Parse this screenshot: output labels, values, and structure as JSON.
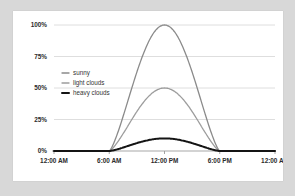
{
  "chart_data": {
    "type": "line",
    "title": "",
    "subtitle": "",
    "xlabel": "",
    "ylabel": "",
    "xlim": [
      0,
      24
    ],
    "ylim": [
      0,
      100
    ],
    "grid": true,
    "legend_position": "upper-left-inside",
    "x_tick_labels": [
      "12:00 AM",
      "6:00 AM",
      "12:00 PM",
      "6:00 PM",
      "12:00 AM"
    ],
    "x_tick_values": [
      0,
      6,
      12,
      18,
      24
    ],
    "y_tick_labels": [
      "0%",
      "25%",
      "50%",
      "75%",
      "100%"
    ],
    "y_tick_values": [
      0,
      25,
      50,
      75,
      100
    ],
    "x": [
      0,
      1,
      2,
      3,
      4,
      5,
      6,
      7,
      8,
      9,
      10,
      11,
      12,
      13,
      14,
      15,
      16,
      17,
      18,
      19,
      20,
      21,
      22,
      23,
      24
    ],
    "series": [
      {
        "name": "sunny",
        "color": "#8a8a8a",
        "width": 1.3,
        "peak": 100,
        "values": [
          0,
          0,
          0,
          0,
          0,
          0,
          0,
          25.9,
          50.0,
          70.7,
          86.6,
          96.6,
          100,
          96.6,
          86.6,
          70.7,
          50.0,
          25.9,
          0,
          0,
          0,
          0,
          0,
          0,
          0
        ]
      },
      {
        "name": "light clouds",
        "color": "#9d9d9d",
        "width": 1.3,
        "peak": 50,
        "values": [
          0,
          0,
          0,
          0,
          0,
          0,
          0,
          12.9,
          25.0,
          35.4,
          43.3,
          48.3,
          50,
          48.3,
          43.3,
          35.4,
          25.0,
          12.9,
          0,
          0,
          0,
          0,
          0,
          0,
          0
        ]
      },
      {
        "name": "heavy clouds",
        "color": "#141414",
        "width": 2.0,
        "peak": 10,
        "values": [
          0,
          0,
          0,
          0,
          0,
          0,
          0,
          2.6,
          5.0,
          7.1,
          8.7,
          9.7,
          10,
          9.7,
          8.7,
          7.1,
          5.0,
          2.6,
          0,
          0,
          0,
          0,
          0,
          0,
          0
        ]
      }
    ]
  },
  "legend": {
    "items": [
      {
        "label": "sunny"
      },
      {
        "label": "light clouds"
      },
      {
        "label": "heavy clouds"
      }
    ]
  },
  "colors": {
    "page_background": "#d8d8d8",
    "card_background": "#ffffff",
    "grid": "#d6d6d6",
    "axis": "#a8a8a8",
    "text": "#2b2b2b"
  }
}
